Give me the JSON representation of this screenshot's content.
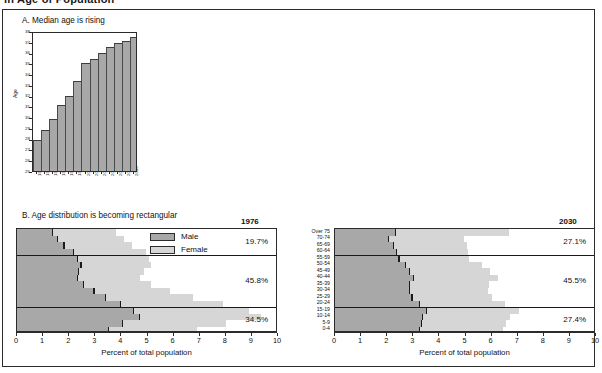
{
  "top_caption": "in Age of Population",
  "panel_a": {
    "title": "A. Median age is rising",
    "y_axis_label": "Age"
  },
  "panel_b": {
    "title": "B. Age distribution is becoming rectangular",
    "x_axis_title": "Percent of total population",
    "legend": [
      {
        "key": "male",
        "label": "Male",
        "color": "#a8a8a8"
      },
      {
        "key": "female",
        "label": "Female",
        "color": "#d6d6d6"
      }
    ],
    "age_groups": [
      "Over 75",
      "70-74",
      "65-69",
      "60-64",
      "55-59",
      "50-54",
      "45-49",
      "40-44",
      "35-39",
      "30-34",
      "25-29",
      "20-24",
      "15-19",
      "10-14",
      "5-9",
      "0-4"
    ]
  },
  "chart_data": [
    {
      "type": "area",
      "id": "median-age",
      "title": "A. Median age is rising",
      "xlabel": "",
      "ylabel": "Age",
      "ylim": [
        25,
        38
      ],
      "grid": false,
      "categories": [
        "1970",
        "1975",
        "1980",
        "1985",
        "1990",
        "1995",
        "2000",
        "2005",
        "2010",
        "2015",
        "2020",
        "2025",
        "2030"
      ],
      "values": [
        27.9,
        28.8,
        29.8,
        31.1,
        32.0,
        33.4,
        35.0,
        35.4,
        36.0,
        36.5,
        36.9,
        37.1,
        37.4
      ],
      "ytick_labels": [
        "25",
        "26",
        "27",
        "28",
        "29",
        "30",
        "31",
        "32",
        "33",
        "34",
        "35",
        "36",
        "37",
        "38"
      ]
    },
    {
      "type": "bar",
      "id": "pyramid-1976",
      "title": "1976",
      "orientation": "horizontal",
      "xlabel": "Percent of total population",
      "ylabel": "",
      "xlim": [
        0,
        10
      ],
      "xtick_labels": [
        "0",
        "1",
        "2",
        "3",
        "4",
        "5",
        "6",
        "7",
        "8",
        "9",
        "10"
      ],
      "categories": [
        "Over 75",
        "70-74",
        "65-69",
        "60-64",
        "55-59",
        "50-54",
        "45-49",
        "40-44",
        "35-39",
        "30-34",
        "25-29",
        "20-24",
        "15-19",
        "10-14",
        "5-9",
        "0-4"
      ],
      "series": [
        {
          "name": "Male",
          "values": [
            1.35,
            1.55,
            1.8,
            2.15,
            2.3,
            2.45,
            2.35,
            2.3,
            2.55,
            2.95,
            3.4,
            3.95,
            4.45,
            4.7,
            4.05,
            3.5
          ]
        },
        {
          "name": "Female",
          "values": [
            2.45,
            2.55,
            2.6,
            2.8,
            2.75,
            2.7,
            2.5,
            2.4,
            2.6,
            2.9,
            3.35,
            3.95,
            4.45,
            4.65,
            3.95,
            3.4
          ]
        }
      ],
      "segment_totals": [
        {
          "label": "19.7%",
          "groups": [
            "Over 75",
            "70-74",
            "65-69",
            "60-64"
          ]
        },
        {
          "label": "45.8%",
          "groups": [
            "55-59",
            "50-54",
            "45-49",
            "40-44",
            "35-39",
            "30-34",
            "25-29",
            "20-24"
          ]
        },
        {
          "label": "34.5%",
          "groups": [
            "15-19",
            "10-14",
            "5-9",
            "0-4"
          ]
        }
      ]
    },
    {
      "type": "bar",
      "id": "pyramid-2030",
      "title": "2030",
      "orientation": "horizontal",
      "xlabel": "Percent of total population",
      "ylabel": "",
      "xlim": [
        0,
        10
      ],
      "xtick_labels": [
        "0",
        "1",
        "2",
        "3",
        "4",
        "5",
        "6",
        "7",
        "8",
        "9",
        "10"
      ],
      "categories": [
        "Over 75",
        "70-74",
        "65-69",
        "60-64",
        "55-59",
        "50-54",
        "45-49",
        "40-44",
        "35-39",
        "30-34",
        "25-29",
        "20-24",
        "15-19",
        "10-14",
        "5-9",
        "0-4"
      ],
      "series": [
        {
          "name": "Male",
          "values": [
            2.3,
            2.05,
            2.25,
            2.35,
            2.45,
            2.7,
            2.85,
            3.0,
            2.85,
            2.85,
            2.95,
            3.25,
            3.5,
            3.35,
            3.3,
            3.25
          ]
        },
        {
          "name": "Female",
          "values": [
            4.35,
            2.9,
            2.8,
            2.75,
            2.7,
            2.95,
            3.1,
            3.25,
            3.05,
            3.0,
            3.05,
            3.25,
            3.55,
            3.35,
            3.25,
            3.2
          ]
        }
      ],
      "segment_totals": [
        {
          "label": "27.1%",
          "groups": [
            "Over 75",
            "70-74",
            "65-69",
            "60-64"
          ]
        },
        {
          "label": "45.5%",
          "groups": [
            "55-59",
            "50-54",
            "45-49",
            "40-44",
            "35-39",
            "30-34",
            "25-29",
            "20-24"
          ]
        },
        {
          "label": "27.4%",
          "groups": [
            "15-19",
            "10-14",
            "5-9",
            "0-4"
          ]
        }
      ]
    }
  ]
}
